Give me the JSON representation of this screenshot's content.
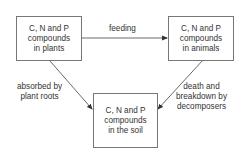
{
  "diagram": {
    "nodes": {
      "plants": {
        "lines": [
          "C, N and P",
          "compounds",
          "in plants"
        ]
      },
      "animals": {
        "lines": [
          "C, N and P",
          "compounds",
          "in animals"
        ]
      },
      "soil": {
        "lines": [
          "C, N and P",
          "compounds",
          "in the soil"
        ]
      }
    },
    "edges": {
      "feeding": {
        "from": "plants",
        "to": "animals",
        "lines": [
          "feeding"
        ]
      },
      "absorbed": {
        "from": "soil",
        "to": "plants",
        "lines": [
          "absorbed by",
          "plant roots"
        ]
      },
      "death": {
        "from": "animals",
        "to": "soil",
        "lines": [
          "death and",
          "breakdown by",
          "decomposers"
        ]
      }
    },
    "colors": {
      "line": "#444444",
      "border": "#777777",
      "text": "#333333"
    }
  }
}
